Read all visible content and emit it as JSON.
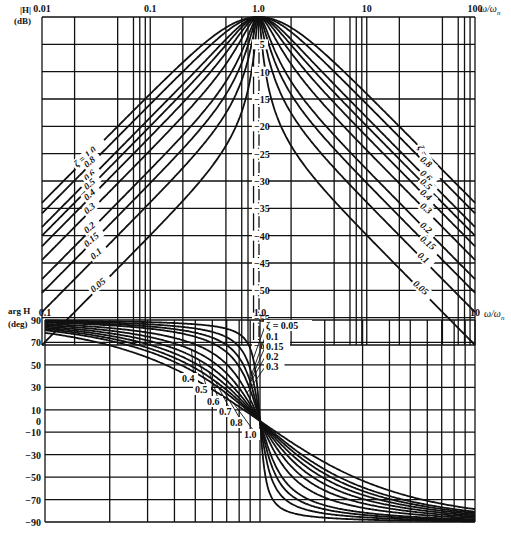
{
  "chart_data": [
    {
      "type": "line",
      "title": "Magnitude of normalized second-order bandpass response",
      "ylabel": "|H| (dB)",
      "ylabel_lines": [
        "|H|",
        "(dB)"
      ],
      "xlabel": "ω/ωn",
      "xscale": "log",
      "xlim": [
        0.01,
        100
      ],
      "ylim": [
        -60,
        0
      ],
      "x_tick_labels": [
        "0.01",
        "0.1",
        "1.0",
        "10",
        "100"
      ],
      "x_ticks": [
        0.01,
        0.1,
        1,
        10,
        100
      ],
      "y_ticks": [
        0,
        -5,
        -10,
        -15,
        -20,
        -25,
        -30,
        -35,
        -40,
        -45,
        -50,
        -55,
        -60
      ],
      "y_tick_labels": [
        "-5",
        "-10",
        "-15",
        "-20",
        "-25",
        "-30",
        "-35",
        "-40",
        "-45",
        "-50",
        "-55",
        "-60"
      ],
      "grid": true,
      "x_grid_minor": [
        2,
        5,
        7,
        8,
        9
      ],
      "formula": "|H| = 2ζu / sqrt((1-u²)² + (2ζu)²), u = ω/ωn",
      "series_param": "ζ",
      "zeta": [
        0.05,
        0.1,
        0.15,
        0.2,
        0.3,
        0.4,
        0.5,
        0.6,
        0.8,
        1.0
      ],
      "series": [
        {
          "name": "ζ = 0.05",
          "values_db": {
            "0.01": -60.0,
            "0.1": -39.9,
            "0.5": -17.5,
            "1": 0,
            "2": -17.5,
            "10": -39.9,
            "100": -60.0
          }
        },
        {
          "name": "ζ = 0.1",
          "values_db": {
            "0.01": -54.0,
            "0.1": -33.9,
            "0.5": -11.6,
            "1": 0,
            "2": -11.6,
            "10": -33.9,
            "100": -54.0
          }
        },
        {
          "name": "ζ = 0.15",
          "values_db": {
            "0.01": -50.5,
            "0.1": -30.4,
            "0.5": -8.3,
            "1": 0,
            "2": -8.3,
            "10": -30.4,
            "100": -50.5
          }
        },
        {
          "name": "ζ = 0.2",
          "values_db": {
            "0.01": -48.0,
            "0.1": -27.9,
            "0.5": -6.2,
            "1": 0,
            "2": -6.2,
            "10": -27.9,
            "100": -48.0
          }
        },
        {
          "name": "ζ = 0.3",
          "values_db": {
            "0.01": -44.4,
            "0.1": -24.4,
            "0.5": -3.5,
            "1": 0,
            "2": -3.5,
            "10": -24.4,
            "100": -44.4
          }
        },
        {
          "name": "ζ = 0.4",
          "values_db": {
            "0.01": -42.0,
            "0.1": -22.0,
            "0.5": -2.2,
            "1": 0,
            "2": -2.2,
            "10": -22.0,
            "100": -42.0
          }
        },
        {
          "name": "ζ = 0.5",
          "values_db": {
            "0.01": -40.0,
            "0.1": -20.0,
            "0.5": -1.6,
            "1": 0,
            "2": -1.6,
            "10": -20.0,
            "100": -40.0
          }
        },
        {
          "name": "ζ = 0.6",
          "values_db": {
            "0.01": -38.4,
            "0.1": -18.5,
            "0.5": -1.1,
            "1": 0,
            "2": -1.1,
            "10": -18.5,
            "100": -38.4
          }
        },
        {
          "name": "ζ = 0.8",
          "values_db": {
            "0.01": -35.9,
            "0.1": -16.0,
            "0.5": -0.7,
            "1": 0,
            "2": -0.7,
            "10": -16.0,
            "100": -35.9
          }
        },
        {
          "name": "ζ = 1.0",
          "values_db": {
            "0.01": -34.0,
            "0.1": -14.1,
            "0.5": -0.4,
            "1": 0,
            "2": -0.4,
            "10": -14.1,
            "100": -34.0
          }
        }
      ],
      "annotations": {
        "left_labels": [
          "ζ = 1.0",
          "0.8",
          "0.6",
          "0.5",
          "0.4",
          "0.3",
          "0.2",
          "0.15",
          "0.1",
          "0.05"
        ],
        "right_labels": [
          "ζ = 1.0",
          "0.8",
          "0.6",
          "0.5",
          "0.4",
          "0.3",
          "0.2",
          "0.15",
          "0.1",
          "0.05"
        ]
      }
    },
    {
      "type": "line",
      "title": "Phase of normalized second-order bandpass response",
      "ylabel": "arg H (deg)",
      "ylabel_lines": [
        "arg H",
        "(deg)"
      ],
      "xlabel": "ω/ωn",
      "xscale": "log",
      "xlim": [
        0.1,
        10
      ],
      "ylim": [
        -90,
        90
      ],
      "x_tick_labels": [
        "0.1",
        "1.0",
        "10"
      ],
      "x_ticks": [
        0.1,
        1,
        10
      ],
      "y_ticks": [
        90,
        70,
        50,
        30,
        10,
        0,
        -10,
        -30,
        -50,
        -70,
        -90
      ],
      "y_tick_labels": [
        "90",
        "70",
        "50",
        "30",
        "10",
        "0",
        "-10",
        "-30",
        "-50",
        "-70",
        "-90"
      ],
      "grid": true,
      "formula": "arg H = 90° − atan2(2ζu, 1 − u²), u = ω/ωn",
      "series_param": "ζ",
      "zeta": [
        0.05,
        0.1,
        0.15,
        0.2,
        0.3,
        0.4,
        0.5,
        0.6,
        0.7,
        0.8,
        1.0
      ],
      "series": [
        {
          "name": "ζ = 0.05",
          "values_deg": {
            "0.1": 89.4,
            "0.5": 86.2,
            "1": 0,
            "2": -86.2,
            "10": -89.4
          }
        },
        {
          "name": "ζ = 0.1",
          "values_deg": {
            "0.1": 88.8,
            "0.5": 82.4,
            "1": 0,
            "2": -82.4,
            "10": -88.8
          }
        },
        {
          "name": "ζ = 0.15",
          "values_deg": {
            "0.1": 88.3,
            "0.5": 78.7,
            "1": 0,
            "2": -78.7,
            "10": -88.3
          }
        },
        {
          "name": "ζ = 0.2",
          "values_deg": {
            "0.1": 87.7,
            "0.5": 75.1,
            "1": 0,
            "2": -75.1,
            "10": -87.7
          }
        },
        {
          "name": "ζ = 0.3",
          "values_deg": {
            "0.1": 86.5,
            "0.5": 68.2,
            "1": 0,
            "2": -68.2,
            "10": -86.5
          }
        },
        {
          "name": "ζ = 0.4",
          "values_deg": {
            "0.1": 85.4,
            "0.5": 61.9,
            "1": 0,
            "2": -61.9,
            "10": -85.4
          }
        },
        {
          "name": "ζ = 0.5",
          "values_deg": {
            "0.1": 84.2,
            "0.5": 56.3,
            "1": 0,
            "2": -56.3,
            "10": -84.2
          }
        },
        {
          "name": "ζ = 0.6",
          "values_deg": {
            "0.1": 83.1,
            "0.5": 51.3,
            "1": 0,
            "2": -51.3,
            "10": -83.1
          }
        },
        {
          "name": "ζ = 0.7",
          "values_deg": {
            "0.1": 81.9,
            "0.5": 47.0,
            "1": 0,
            "2": -47.0,
            "10": -81.9
          }
        },
        {
          "name": "ζ = 0.8",
          "values_deg": {
            "0.1": 80.8,
            "0.5": 43.2,
            "1": 0,
            "2": -43.2,
            "10": -80.8
          }
        },
        {
          "name": "ζ = 1.0",
          "values_deg": {
            "0.1": 78.6,
            "0.5": 36.9,
            "1": 0,
            "2": -36.9,
            "10": -78.6
          }
        }
      ],
      "annotations": {
        "left_labels": [
          "0.4",
          "0.5",
          "0.6",
          "0.7",
          "0.8",
          "1.0"
        ],
        "right_labels": [
          "ζ = 0.05",
          "0.1",
          "0.15",
          "0.2",
          "0.3"
        ]
      }
    }
  ],
  "layout": {
    "mag": {
      "x0": 42,
      "x1": 475,
      "y0": 17,
      "y1": 345,
      "axis_x": 258
    },
    "phase": {
      "x0": 45,
      "x1": 475,
      "y0": 320,
      "y1": 522,
      "axis_x": 258
    }
  },
  "labels": {
    "mag_y_line1": "|H|",
    "mag_y_line2": "(dB)",
    "mag_x_unit": "ω/ω",
    "mag_x_unit_sub": "n",
    "phase_y_line1": "arg H",
    "phase_y_line2": "(deg)",
    "phase_x_unit": "ω/ω",
    "phase_x_unit_sub": "n"
  },
  "colors": {
    "ink": "#111111",
    "background": "#ffffff"
  }
}
